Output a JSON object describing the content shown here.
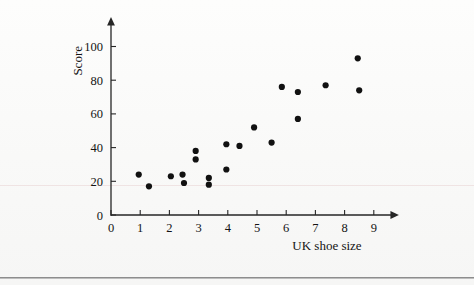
{
  "page": {
    "background_color": "#fbfbfa",
    "rule_color": "#8d8d8d"
  },
  "chart_data": {
    "type": "scatter",
    "title": "",
    "xlabel": "UK shoe size",
    "ylabel": "Score",
    "xlim": [
      0,
      9.6
    ],
    "ylim": [
      0,
      108
    ],
    "xticks": [
      0,
      1,
      2,
      3,
      4,
      5,
      6,
      7,
      8,
      9
    ],
    "xtick_labels": [
      "0",
      "1",
      "2",
      "3",
      "4",
      "5",
      "6",
      "7",
      "8",
      "9"
    ],
    "yticks": [
      0,
      20,
      40,
      60,
      80,
      100
    ],
    "ytick_labels": [
      "0",
      "20",
      "40",
      "60",
      "80",
      "100"
    ],
    "grid": false,
    "legend": false,
    "marker": {
      "shape": "circle",
      "color": "#111111",
      "radius": 3.1
    },
    "series": [
      {
        "name": "Score vs UK shoe size",
        "points": [
          {
            "x": 0.95,
            "y": 24
          },
          {
            "x": 1.3,
            "y": 17
          },
          {
            "x": 2.05,
            "y": 23
          },
          {
            "x": 2.45,
            "y": 24
          },
          {
            "x": 2.5,
            "y": 19
          },
          {
            "x": 2.9,
            "y": 38
          },
          {
            "x": 2.9,
            "y": 33
          },
          {
            "x": 3.35,
            "y": 22
          },
          {
            "x": 3.35,
            "y": 18
          },
          {
            "x": 3.95,
            "y": 42
          },
          {
            "x": 3.95,
            "y": 27
          },
          {
            "x": 4.4,
            "y": 41
          },
          {
            "x": 4.9,
            "y": 52
          },
          {
            "x": 5.5,
            "y": 43
          },
          {
            "x": 5.85,
            "y": 76
          },
          {
            "x": 6.4,
            "y": 73
          },
          {
            "x": 6.4,
            "y": 57
          },
          {
            "x": 7.35,
            "y": 77
          },
          {
            "x": 8.45,
            "y": 93
          },
          {
            "x": 8.5,
            "y": 74
          }
        ]
      }
    ]
  }
}
